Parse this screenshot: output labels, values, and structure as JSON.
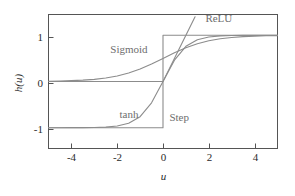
{
  "chart_data": {
    "type": "line",
    "title": "",
    "xlabel": "u",
    "ylabel": "h(u)",
    "xlim": [
      -5,
      5
    ],
    "ylim": [
      -1.45,
      1.45
    ],
    "grid": false,
    "legend_position": "inline-annotations",
    "xticks": [
      -4,
      -2,
      0,
      2,
      4
    ],
    "xticklabels": [
      "-4",
      "-2",
      "0",
      "2",
      "4"
    ],
    "yticks": [
      -1,
      0,
      1
    ],
    "yticklabels": [
      "-1",
      "0",
      "1"
    ],
    "colors": {
      "curve": "#8c8c8c",
      "axis": "#555555",
      "text": "#2b2b2b",
      "label": "#6e6e6e"
    },
    "series": [
      {
        "name": "Sigmoid",
        "label": "Sigmoid",
        "label_x": -2.3,
        "label_y": 0.62,
        "formula": "1/(1+exp(-u))",
        "x": [
          -5,
          -4.5,
          -4,
          -3.5,
          -3,
          -2.5,
          -2,
          -1.5,
          -1,
          -0.5,
          0,
          0.5,
          1,
          1.5,
          2,
          2.5,
          3,
          3.5,
          4,
          4.5,
          5
        ],
        "values": [
          0.007,
          0.011,
          0.018,
          0.029,
          0.047,
          0.076,
          0.119,
          0.182,
          0.269,
          0.378,
          0.5,
          0.622,
          0.731,
          0.818,
          0.881,
          0.924,
          0.953,
          0.971,
          0.982,
          0.989,
          0.993
        ]
      },
      {
        "name": "tanh",
        "label": "tanh",
        "label_x": -1.9,
        "label_y": -0.78,
        "formula": "tanh(u)",
        "x": [
          -5,
          -4.5,
          -4,
          -3.5,
          -3,
          -2.5,
          -2,
          -1.5,
          -1,
          -0.5,
          0,
          0.5,
          1,
          1.5,
          2,
          2.5,
          3,
          3.5,
          4,
          4.5,
          5
        ],
        "values": [
          -0.9999,
          -0.9998,
          -0.9993,
          -0.9982,
          -0.9951,
          -0.9866,
          -0.964,
          -0.9051,
          -0.7616,
          -0.4621,
          0,
          0.4621,
          0.7616,
          0.9051,
          0.964,
          0.9866,
          0.9951,
          0.9982,
          0.9993,
          0.9998,
          0.9999
        ]
      },
      {
        "name": "ReLU",
        "label": "ReLU",
        "label_x": 1.85,
        "label_y": 1.28,
        "formula": "max(0,u)",
        "x": [
          -5,
          0,
          1.4
        ],
        "values": [
          0,
          0,
          1.4
        ]
      },
      {
        "name": "Step",
        "label": "Step",
        "label_x": 0.28,
        "label_y": -0.85,
        "formula": "u<0 ? -1 : 1",
        "x": [
          -5,
          0,
          0,
          5
        ],
        "values": [
          -1,
          -1,
          1,
          1
        ]
      }
    ]
  },
  "figure": {
    "xlabel": "u",
    "ylabel": "h(u)",
    "ylabel_parts": {
      "h": "h",
      "open": "(",
      "u": "u",
      "close": ")"
    }
  }
}
